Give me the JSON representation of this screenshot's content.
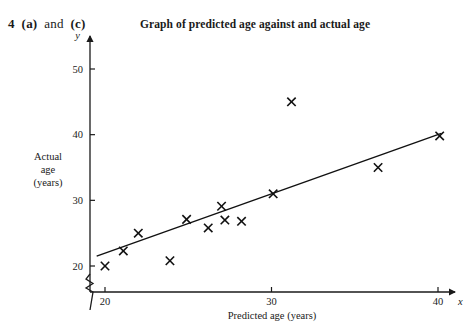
{
  "question": {
    "number": "4",
    "parts_text": "(a) and (c)",
    "part_a": "(a)",
    "conjunction": "and",
    "part_c": "(c)"
  },
  "chart_data": {
    "type": "scatter",
    "title": "Graph of predicted age against and actual age",
    "xlabel": "Predicted age (years)",
    "ylabel": "Actual age (years)",
    "ylabel_lines": [
      "Actual",
      "age",
      "(years)"
    ],
    "x_axis_symbol": "x",
    "y_axis_symbol": "y",
    "xlim": [
      19.0,
      41.2
    ],
    "ylim": [
      18.0,
      53.5
    ],
    "xticks": [
      20,
      30,
      40
    ],
    "xtick_labels": [
      "20",
      "30",
      "40"
    ],
    "yticks": [
      20,
      30,
      40,
      50
    ],
    "ytick_labels": [
      "20",
      "30",
      "40",
      "50"
    ],
    "grid": false,
    "legend": null,
    "axis_break": {
      "present": true,
      "axis": "x",
      "symbol": "zigzag-break"
    },
    "marker_style": "x-cross",
    "points": [
      {
        "x": 20.0,
        "y": 20.0
      },
      {
        "x": 21.1,
        "y": 22.3
      },
      {
        "x": 22.0,
        "y": 25.0
      },
      {
        "x": 23.9,
        "y": 20.8
      },
      {
        "x": 24.9,
        "y": 27.1
      },
      {
        "x": 26.2,
        "y": 25.8
      },
      {
        "x": 27.0,
        "y": 29.1
      },
      {
        "x": 27.2,
        "y": 27.0
      },
      {
        "x": 28.2,
        "y": 26.8
      },
      {
        "x": 30.1,
        "y": 31.0
      },
      {
        "x": 31.2,
        "y": 45.0
      },
      {
        "x": 36.4,
        "y": 35.0
      },
      {
        "x": 40.1,
        "y": 39.8
      }
    ],
    "trend_line": {
      "type": "line-of-best-fit",
      "x_start": 19.5,
      "y_start": 21.5,
      "x_end": 40.2,
      "y_end": 40.2
    }
  }
}
